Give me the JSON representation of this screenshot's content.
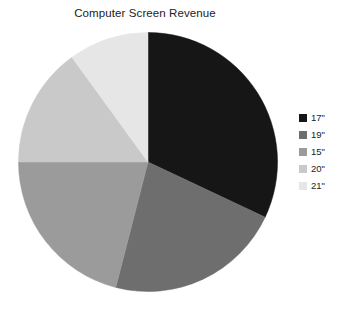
{
  "chart_data": {
    "type": "pie",
    "title": "Computer Screen Revenue",
    "categories": [
      "17\"",
      "19\"",
      "15\"",
      "20\"",
      "21\""
    ],
    "values": [
      32,
      22,
      21,
      15,
      10
    ],
    "units": "percent",
    "start_angle_deg": 0,
    "direction": "clockwise",
    "colors": [
      "#161616",
      "#6e6e6e",
      "#9b9b9b",
      "#c9c9c9",
      "#e6e6e6"
    ],
    "legend": {
      "position": "right",
      "entries": [
        {
          "label": "17\"",
          "color": "#161616",
          "value": 32
        },
        {
          "label": "19\"",
          "color": "#6e6e6e",
          "value": 22
        },
        {
          "label": "15\"",
          "color": "#9b9b9b",
          "value": 21
        },
        {
          "label": "20\"",
          "color": "#c9c9c9",
          "value": 15
        },
        {
          "label": "21\"",
          "color": "#e6e6e6",
          "value": 10
        }
      ]
    },
    "xlabel": "",
    "ylabel": "",
    "grid": false
  },
  "chart": {
    "title": "Computer Screen Revenue"
  }
}
